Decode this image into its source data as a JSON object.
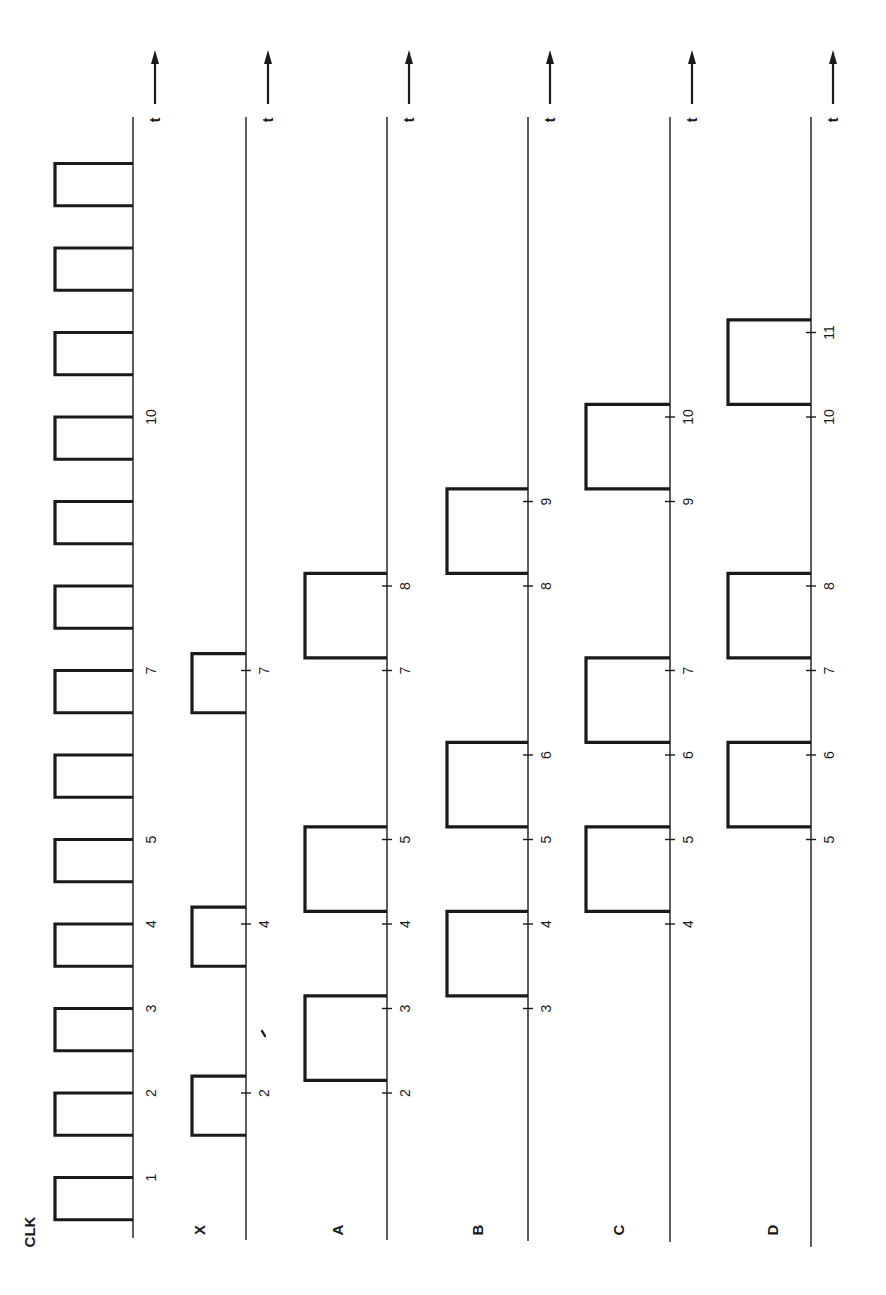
{
  "diagram": {
    "type": "timing-diagram",
    "time_axis_label": "t",
    "time_direction": "up",
    "signals": [
      {
        "name": "CLK",
        "pulses": [
          [
            0.5,
            1.0
          ],
          [
            1.5,
            2.0
          ],
          [
            2.5,
            3.0
          ],
          [
            3.5,
            4.0
          ],
          [
            4.5,
            5.0
          ],
          [
            5.5,
            6.0
          ],
          [
            6.5,
            7.0
          ],
          [
            7.5,
            8.0
          ],
          [
            8.5,
            9.0
          ],
          [
            9.5,
            10.0
          ],
          [
            10.5,
            11.0
          ],
          [
            11.5,
            12.0
          ],
          [
            12.5,
            13.0
          ]
        ],
        "tick_marks": [],
        "labels": [
          {
            "t": 1,
            "text": "1"
          },
          {
            "t": 2,
            "text": "2"
          },
          {
            "t": 3,
            "text": "3"
          },
          {
            "t": 4,
            "text": "4"
          },
          {
            "t": 5,
            "text": "5"
          },
          {
            "t": 7,
            "text": "7"
          },
          {
            "t": 10,
            "text": "10"
          }
        ]
      },
      {
        "name": "X",
        "pulses": [
          [
            1.5,
            2.2
          ],
          [
            3.5,
            4.2
          ],
          [
            6.5,
            7.2
          ]
        ],
        "tick_marks": [
          2,
          4,
          7
        ],
        "labels": [
          {
            "t": 2,
            "text": "2"
          },
          {
            "t": 4,
            "text": "4"
          },
          {
            "t": 7,
            "text": "7"
          }
        ]
      },
      {
        "name": "A",
        "pulses": [
          [
            2.15,
            3.15
          ],
          [
            4.15,
            5.15
          ],
          [
            7.15,
            8.15
          ]
        ],
        "tick_marks": [
          2,
          3,
          4,
          5,
          7,
          8
        ],
        "labels": [
          {
            "t": 2,
            "text": "2"
          },
          {
            "t": 3,
            "text": "3"
          },
          {
            "t": 4,
            "text": "4"
          },
          {
            "t": 5,
            "text": "5"
          },
          {
            "t": 7,
            "text": "7"
          },
          {
            "t": 8,
            "text": "8"
          }
        ]
      },
      {
        "name": "B",
        "pulses": [
          [
            3.15,
            4.15
          ],
          [
            5.15,
            6.15
          ],
          [
            8.15,
            9.15
          ]
        ],
        "tick_marks": [
          3,
          4,
          5,
          6,
          8,
          9
        ],
        "labels": [
          {
            "t": 3,
            "text": "3"
          },
          {
            "t": 4,
            "text": "4"
          },
          {
            "t": 5,
            "text": "5"
          },
          {
            "t": 6,
            "text": "6"
          },
          {
            "t": 8,
            "text": "8"
          },
          {
            "t": 9,
            "text": "9"
          }
        ]
      },
      {
        "name": "C",
        "pulses": [
          [
            4.15,
            5.15
          ],
          [
            6.15,
            7.15
          ],
          [
            9.15,
            10.15
          ]
        ],
        "tick_marks": [
          4,
          5,
          6,
          7,
          9,
          10
        ],
        "labels": [
          {
            "t": 4,
            "text": "4"
          },
          {
            "t": 5,
            "text": "5"
          },
          {
            "t": 6,
            "text": "6"
          },
          {
            "t": 7,
            "text": "7"
          },
          {
            "t": 9,
            "text": "9"
          },
          {
            "t": 10,
            "text": "10"
          }
        ]
      },
      {
        "name": "D",
        "pulses": [
          [
            5.15,
            6.15
          ],
          [
            7.15,
            8.15
          ],
          [
            10.15,
            11.15
          ]
        ],
        "tick_marks": [
          5,
          6,
          7,
          8,
          10,
          11
        ],
        "labels": [
          {
            "t": 5,
            "text": "5"
          },
          {
            "t": 6,
            "text": "6"
          },
          {
            "t": 7,
            "text": "7"
          },
          {
            "t": 8,
            "text": "8"
          },
          {
            "t": 10,
            "text": "10"
          },
          {
            "t": 11,
            "text": "11"
          }
        ]
      }
    ]
  }
}
